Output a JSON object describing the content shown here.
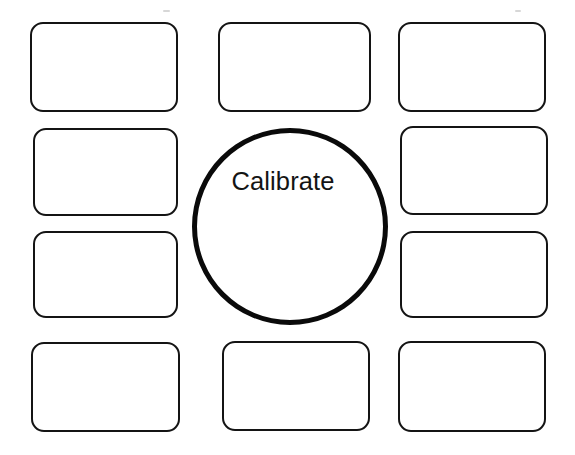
{
  "worksheet": {
    "type": "graphic-organizer",
    "background_color": "#ffffff",
    "ink_color": "#141414",
    "center": {
      "shape": "ellipse",
      "label": "Calibrate",
      "stroke_color": "#0a0a0a",
      "stroke_width_px": 5,
      "x": 192,
      "y": 128,
      "width": 196,
      "height": 197
    },
    "boxes": [
      {
        "id": "box-top-left",
        "label": "",
        "x": 30,
        "y": 22,
        "width": 148,
        "height": 90
      },
      {
        "id": "box-top-center",
        "label": "",
        "x": 218,
        "y": 22,
        "width": 153,
        "height": 90
      },
      {
        "id": "box-top-right",
        "label": "",
        "x": 398,
        "y": 22,
        "width": 148,
        "height": 90
      },
      {
        "id": "box-left-upper",
        "label": "",
        "x": 33,
        "y": 128,
        "width": 145,
        "height": 88
      },
      {
        "id": "box-right-upper",
        "label": "",
        "x": 400,
        "y": 126,
        "width": 148,
        "height": 89
      },
      {
        "id": "box-left-lower",
        "label": "",
        "x": 33,
        "y": 231,
        "width": 145,
        "height": 87
      },
      {
        "id": "box-right-lower",
        "label": "",
        "x": 400,
        "y": 231,
        "width": 148,
        "height": 87
      },
      {
        "id": "box-bottom-left",
        "label": "",
        "x": 31,
        "y": 342,
        "width": 149,
        "height": 90
      },
      {
        "id": "box-bottom-center",
        "label": "",
        "x": 222,
        "y": 341,
        "width": 148,
        "height": 90
      },
      {
        "id": "box-bottom-right",
        "label": "",
        "x": 398,
        "y": 341,
        "width": 148,
        "height": 91
      }
    ],
    "artifacts": [
      {
        "id": "speck-top-left",
        "x": 163,
        "y": 10,
        "width": 7,
        "height": 2
      },
      {
        "id": "speck-top-right",
        "x": 515,
        "y": 10,
        "width": 6,
        "height": 2
      }
    ]
  }
}
